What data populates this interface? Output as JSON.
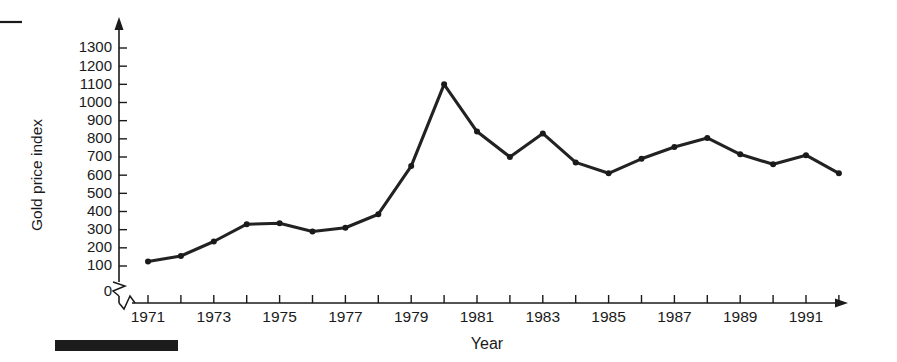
{
  "figure": {
    "caption_rule": "top-left-dash",
    "footer_bar": "solid-black-bar"
  },
  "chart_data": {
    "type": "line",
    "title": "",
    "xlabel": "Year",
    "ylabel": "Gold price index",
    "xlim": [
      1970.5,
      1992.5
    ],
    "ylim": [
      0,
      1350
    ],
    "yticks": [
      0,
      100,
      200,
      300,
      400,
      500,
      600,
      700,
      800,
      900,
      1000,
      1100,
      1200,
      1300
    ],
    "ytick_labels": [
      "0",
      "100",
      "200",
      "300",
      "400",
      "500",
      "600",
      "700",
      "800",
      "900",
      "1000",
      "1100",
      "1200",
      "1300"
    ],
    "y_axis_break": true,
    "y_axis_break_between": [
      0,
      100
    ],
    "x_axis_break": true,
    "xticks": [
      1971,
      1972,
      1973,
      1974,
      1975,
      1976,
      1977,
      1978,
      1979,
      1980,
      1981,
      1982,
      1983,
      1984,
      1985,
      1986,
      1987,
      1988,
      1989,
      1990,
      1991,
      1992
    ],
    "xtick_labels_shown": [
      "1971",
      "1973",
      "1975",
      "1977",
      "1979",
      "1981",
      "1983",
      "1985",
      "1987",
      "1989",
      "1991"
    ],
    "grid": false,
    "legend": false,
    "markers": true,
    "line_color": "#222222",
    "marker_color": "#1a1a1a",
    "x": [
      1971,
      1972,
      1973,
      1974,
      1975,
      1976,
      1977,
      1978,
      1979,
      1980,
      1981,
      1982,
      1983,
      1984,
      1985,
      1986,
      1987,
      1988,
      1989,
      1990,
      1991,
      1992
    ],
    "values": [
      125,
      155,
      235,
      330,
      335,
      290,
      310,
      385,
      650,
      1100,
      840,
      700,
      830,
      670,
      610,
      690,
      755,
      805,
      715,
      660,
      710,
      610
    ],
    "series": [
      {
        "name": "Gold price index",
        "values": [
          125,
          155,
          235,
          330,
          335,
          290,
          310,
          385,
          650,
          1100,
          840,
          700,
          830,
          670,
          610,
          690,
          755,
          805,
          715,
          660,
          710,
          610
        ]
      }
    ]
  }
}
